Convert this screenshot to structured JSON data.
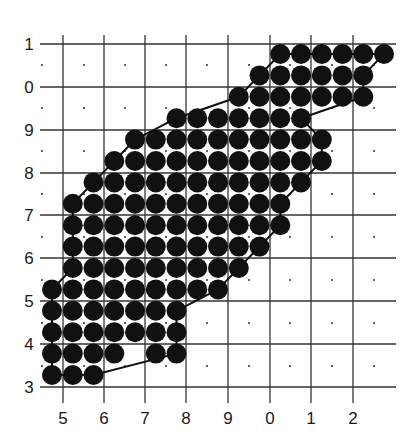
{
  "figure": {
    "background": "#ffffff",
    "line_color": "#333333",
    "dot_color": "#333333",
    "circle_color": "#111111",
    "outline_color": "#111111"
  },
  "axes": {
    "y_labels": [
      "1",
      "0",
      "9",
      "8",
      "7",
      "6",
      "5",
      "4",
      "3"
    ],
    "x_labels": [
      "5",
      "6",
      "7",
      "8",
      "9",
      "0",
      "1",
      "2"
    ]
  },
  "grid": {
    "vertical_lines_x": [
      63,
      104,
      145,
      186,
      228,
      270,
      311,
      353
    ],
    "horizontal_lines_y": [
      44,
      87,
      130,
      173,
      215,
      258,
      301,
      344,
      387
    ],
    "h_line_x_range": [
      40,
      396
    ],
    "v_line_y_range": [
      35,
      403
    ],
    "dot_x": [
      42,
      84,
      125,
      166,
      207,
      249,
      290,
      332,
      374
    ],
    "dot_y": [
      65,
      108,
      151,
      194,
      237,
      280,
      323,
      366
    ]
  },
  "circles": {
    "origin_x": 52,
    "origin_y": 54,
    "step_x": 20.75,
    "step_y": 21.4,
    "radius": 10,
    "rows": [
      {
        "row": 0,
        "cols": [
          [
            11,
            16
          ]
        ]
      },
      {
        "row": 1,
        "cols": [
          [
            10,
            15
          ]
        ]
      },
      {
        "row": 2,
        "cols": [
          [
            9,
            15
          ]
        ]
      },
      {
        "row": 3,
        "cols": [
          [
            6,
            12
          ]
        ]
      },
      {
        "row": 4,
        "cols": [
          [
            4,
            13
          ]
        ]
      },
      {
        "row": 5,
        "cols": [
          [
            3,
            13
          ]
        ]
      },
      {
        "row": 6,
        "cols": [
          [
            2,
            12
          ]
        ]
      },
      {
        "row": 7,
        "cols": [
          [
            1,
            11
          ]
        ]
      },
      {
        "row": 8,
        "cols": [
          [
            1,
            11
          ]
        ]
      },
      {
        "row": 9,
        "cols": [
          [
            1,
            10
          ]
        ]
      },
      {
        "row": 10,
        "cols": [
          [
            1,
            9
          ]
        ]
      },
      {
        "row": 11,
        "cols": [
          [
            0,
            8
          ]
        ]
      },
      {
        "row": 12,
        "cols": [
          [
            0,
            6
          ]
        ]
      },
      {
        "row": 13,
        "cols": [
          [
            0,
            6
          ]
        ]
      },
      {
        "row": 14,
        "cols": [
          [
            0,
            3
          ],
          [
            5,
            6
          ]
        ]
      },
      {
        "row": 15,
        "cols": [
          [
            0,
            2
          ]
        ]
      }
    ]
  }
}
